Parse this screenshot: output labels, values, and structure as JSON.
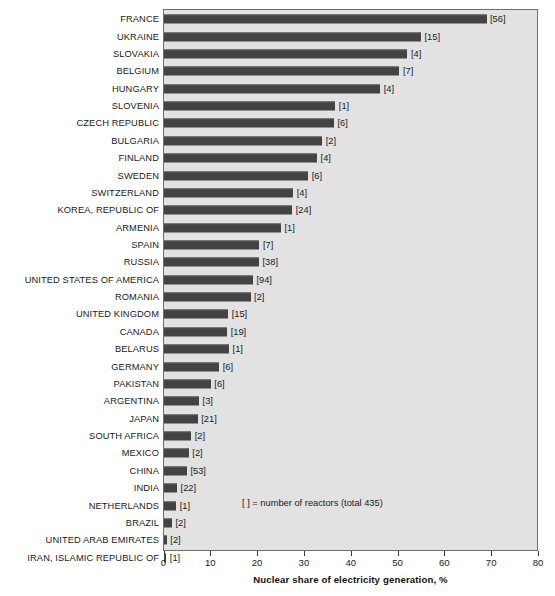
{
  "chart_data": {
    "type": "bar",
    "orientation": "horizontal",
    "title": "",
    "xlabel": "Nuclear share of electricity generation, %",
    "ylabel": "",
    "xlim": [
      0,
      80
    ],
    "xticks": [
      0,
      10,
      20,
      30,
      40,
      50,
      60,
      70,
      80
    ],
    "grid": false,
    "legend": null,
    "annotation": "[ ] = number of reactors (total 435)",
    "categories": [
      "FRANCE",
      "UKRAINE",
      "SLOVAKIA",
      "BELGIUM",
      "HUNGARY",
      "SLOVENIA",
      "CZECH REPUBLIC",
      "BULGARIA",
      "FINLAND",
      "SWEDEN",
      "SWITZERLAND",
      "KOREA, REPUBLIC OF",
      "ARMENIA",
      "SPAIN",
      "RUSSIA",
      "UNITED STATES OF AMERICA",
      "ROMANIA",
      "UNITED KINGDOM",
      "CANADA",
      "BELARUS",
      "GERMANY",
      "PAKISTAN",
      "ARGENTINA",
      "JAPAN",
      "SOUTH AFRICA",
      "MEXICO",
      "CHINA",
      "INDIA",
      "NETHERLANDS",
      "BRAZIL",
      "UNITED ARAB EMIRATES",
      "IRAN, ISLAMIC REPUBLIC OF"
    ],
    "values": [
      68.9,
      54.9,
      52.0,
      50.3,
      46.2,
      36.6,
      36.3,
      33.8,
      32.7,
      30.8,
      27.6,
      27.4,
      25.0,
      20.4,
      20.3,
      19.0,
      18.5,
      13.7,
      13.5,
      13.9,
      11.8,
      10.0,
      7.5,
      7.2,
      5.8,
      5.3,
      4.9,
      2.8,
      2.6,
      1.7,
      0.6,
      0.5
    ],
    "labels": [
      "[56]",
      "[15]",
      "[4]",
      "[7]",
      "[4]",
      "[1]",
      "[6]",
      "[2]",
      "[4]",
      "[6]",
      "[4]",
      "[24]",
      "[1]",
      "[7]",
      "[38]",
      "[94]",
      "[2]",
      "[15]",
      "[19]",
      "[1]",
      "[6]",
      "[6]",
      "[3]",
      "[21]",
      "[2]",
      "[2]",
      "[53]",
      "[22]",
      "[1]",
      "[2]",
      "[2]",
      "[1]"
    ],
    "reactor_counts": [
      56,
      15,
      4,
      7,
      4,
      1,
      6,
      2,
      4,
      6,
      4,
      24,
      1,
      7,
      38,
      94,
      2,
      15,
      19,
      1,
      6,
      6,
      3,
      21,
      2,
      2,
      53,
      22,
      1,
      2,
      2,
      1
    ],
    "total_reactors": 435,
    "bar_color": "#434343",
    "plot_background": "#e2e2e2"
  }
}
